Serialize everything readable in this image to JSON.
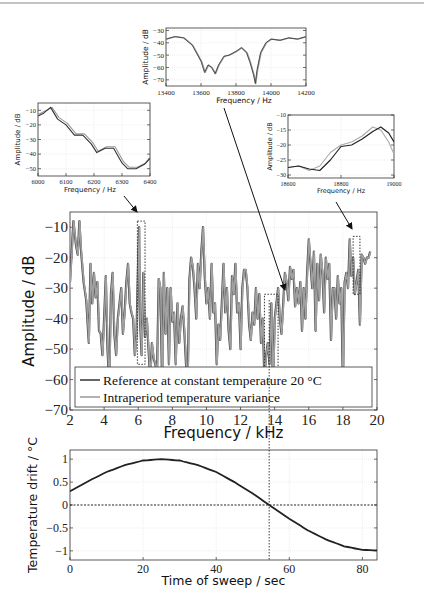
{
  "chart_data": [
    {
      "id": "inset_top",
      "type": "line",
      "xlabel": "Frequency / Hz",
      "ylabel": "Amplitude / dB",
      "xlim": [
        13400,
        14200
      ],
      "ylim": [
        -75,
        -28
      ],
      "xticks": [
        13400,
        13600,
        13800,
        14000,
        14200
      ],
      "yticks": [
        -30,
        -40,
        -50,
        -60,
        -70
      ],
      "grid": true,
      "series": [
        {
          "name": "Reference at constant temperature 20 °C",
          "color": "#444444",
          "x": [
            13400,
            13450,
            13500,
            13550,
            13600,
            13620,
            13640,
            13660,
            13680,
            13700,
            13730,
            13760,
            13800,
            13830,
            13860,
            13880,
            13900,
            13910,
            13920,
            13940,
            13970,
            14000,
            14050,
            14100,
            14150,
            14200
          ],
          "y": [
            -37,
            -35,
            -36,
            -42,
            -55,
            -64,
            -58,
            -60,
            -65,
            -58,
            -51,
            -50,
            -47,
            -44,
            -48,
            -56,
            -66,
            -73,
            -62,
            -48,
            -40,
            -37,
            -38,
            -36,
            -37,
            -35
          ]
        },
        {
          "name": "Intraperiod temperature variance",
          "color": "#999999",
          "x": [
            13400,
            13450,
            13500,
            13550,
            13600,
            13620,
            13640,
            13660,
            13680,
            13700,
            13730,
            13760,
            13800,
            13830,
            13860,
            13880,
            13900,
            13910,
            13920,
            13940,
            13970,
            14000,
            14050,
            14100,
            14150,
            14200
          ],
          "y": [
            -37,
            -35,
            -36,
            -42,
            -55,
            -64,
            -58,
            -60,
            -65,
            -58,
            -51,
            -50,
            -47,
            -44,
            -48,
            -56,
            -66,
            -73,
            -62,
            -48,
            -40,
            -37,
            -38,
            -36,
            -37,
            -35
          ]
        }
      ]
    },
    {
      "id": "inset_left",
      "type": "line",
      "xlabel": "Frequency / Hz",
      "ylabel": "Amplitude / dB",
      "xlim": [
        6000,
        6400
      ],
      "ylim": [
        -55,
        -5
      ],
      "xticks": [
        6000,
        6100,
        6200,
        6300,
        6400
      ],
      "yticks": [
        -10,
        -20,
        -30,
        -40,
        -50
      ],
      "grid": true,
      "series": [
        {
          "name": "Reference at constant temperature 20 °C",
          "color": "#333333",
          "x": [
            6000,
            6020,
            6045,
            6070,
            6100,
            6130,
            6160,
            6190,
            6210,
            6240,
            6270,
            6300,
            6320,
            6350,
            6380,
            6400
          ],
          "y": [
            -14,
            -12,
            -8,
            -16,
            -20,
            -27,
            -27,
            -33,
            -39,
            -36,
            -36,
            -46,
            -50,
            -50,
            -47,
            -43
          ]
        },
        {
          "name": "Intraperiod temperature variance",
          "color": "#999999",
          "x": [
            6000,
            6020,
            6050,
            6075,
            6105,
            6135,
            6165,
            6195,
            6215,
            6245,
            6275,
            6305,
            6325,
            6355,
            6385,
            6400
          ],
          "y": [
            -13,
            -11,
            -8,
            -15,
            -19,
            -26,
            -26,
            -32,
            -38,
            -35,
            -35,
            -45,
            -49,
            -49,
            -46,
            -42
          ]
        }
      ]
    },
    {
      "id": "inset_right",
      "type": "line",
      "xlabel": "Frequency / Hz",
      "ylabel": "Amplitude / dB",
      "xlim": [
        18600,
        19000
      ],
      "ylim": [
        -31,
        -10
      ],
      "xticks": [
        18600,
        18800,
        19000
      ],
      "yticks": [
        -10,
        -15,
        -20,
        -25,
        -30
      ],
      "grid": true,
      "series": [
        {
          "name": "Reference at constant temperature 20 °C",
          "color": "#222222",
          "x": [
            18600,
            18640,
            18680,
            18720,
            18760,
            18800,
            18840,
            18880,
            18920,
            18950,
            18980,
            19000
          ],
          "y": [
            -27.5,
            -27,
            -28,
            -28.5,
            -25,
            -20.5,
            -20,
            -18,
            -15.5,
            -14,
            -16,
            -19
          ]
        },
        {
          "name": "Intraperiod temperature variance",
          "color": "#aaaaaa",
          "x": [
            18600,
            18640,
            18680,
            18720,
            18760,
            18800,
            18840,
            18880,
            18920,
            18950,
            18980,
            19000
          ],
          "y": [
            -27.5,
            -27,
            -28.5,
            -27,
            -22.5,
            -20,
            -19,
            -17,
            -14,
            -15,
            -19,
            -23
          ]
        }
      ]
    },
    {
      "id": "main",
      "type": "line",
      "xlabel": "Frequency / kHz",
      "ylabel": "Amplitude / dB",
      "xlim": [
        2,
        20
      ],
      "ylim": [
        -70,
        -5
      ],
      "xticks": [
        2,
        4,
        6,
        8,
        10,
        12,
        14,
        16,
        18,
        20
      ],
      "yticks": [
        -10,
        -20,
        -30,
        -40,
        -50,
        -60,
        -70
      ],
      "grid": true,
      "legend": {
        "position": "lower left",
        "entries": [
          "Reference at constant temperature 20 °C",
          "Intraperiod temperature variance"
        ]
      },
      "zoom_boxes": [
        {
          "x": [
            5.95,
            6.4
          ],
          "y": [
            -8,
            -55
          ]
        },
        {
          "x": [
            13.4,
            14.2
          ],
          "y": [
            -32,
            -62
          ]
        },
        {
          "x": [
            18.6,
            19.0
          ],
          "y": [
            -13,
            -32
          ]
        }
      ],
      "series": [
        {
          "name": "Reference at constant temperature 20 °C",
          "color": "#444444",
          "x": [
            2.0,
            2.1,
            2.2,
            2.35,
            2.45,
            2.55,
            2.65,
            2.8,
            2.95,
            3.1,
            3.2,
            3.3,
            3.4,
            3.5,
            3.6,
            3.7,
            3.8,
            3.9,
            4.0,
            4.1,
            4.2,
            4.3,
            4.4,
            4.5,
            4.6,
            4.7,
            4.8,
            4.9,
            5.0,
            5.1,
            5.2,
            5.3,
            5.4,
            5.5,
            5.6,
            5.7,
            5.8,
            5.9,
            6.0,
            6.05,
            6.1,
            6.2,
            6.3,
            6.4,
            6.5,
            6.6,
            6.7,
            6.8,
            6.9,
            7.0,
            7.1,
            7.2,
            7.3,
            7.4,
            7.5,
            7.6,
            7.7,
            7.8,
            7.9,
            8.0,
            8.1,
            8.2,
            8.3,
            8.4,
            8.5,
            8.6,
            8.7,
            8.8,
            8.9,
            9.0,
            9.1,
            9.2,
            9.3,
            9.4,
            9.5,
            9.6,
            9.7,
            9.8,
            9.9,
            10.0,
            10.1,
            10.2,
            10.3,
            10.4,
            10.5,
            10.6,
            10.7,
            10.8,
            10.9,
            11.0,
            11.1,
            11.2,
            11.3,
            11.4,
            11.5,
            11.6,
            11.7,
            11.8,
            11.9,
            12.0,
            12.1,
            12.2,
            12.3,
            12.4,
            12.5,
            12.6,
            12.7,
            12.8,
            12.9,
            13.0,
            13.1,
            13.2,
            13.3,
            13.4,
            13.5,
            13.6,
            13.7,
            13.8,
            13.9,
            14.0,
            14.1,
            14.2,
            14.3,
            14.4,
            14.5,
            14.6,
            14.7,
            14.8,
            14.9,
            15.0,
            15.1,
            15.2,
            15.3,
            15.4,
            15.5,
            15.6,
            15.7,
            15.8,
            15.9,
            16.0,
            16.1,
            16.2,
            16.3,
            16.4,
            16.5,
            16.6,
            16.7,
            16.8,
            16.9,
            17.0,
            17.1,
            17.2,
            17.3,
            17.4,
            17.5,
            17.6,
            17.7,
            17.8,
            17.9,
            18.0,
            18.1,
            18.2,
            18.3,
            18.4,
            18.5,
            18.6,
            18.7,
            18.8,
            18.9,
            19.0,
            19.1,
            19.2,
            19.3,
            19.4,
            19.5,
            19.6,
            19.7,
            19.8,
            19.9,
            20.0
          ],
          "y": [
            -28,
            -18,
            -8,
            -16,
            -19,
            -8,
            -18,
            -28,
            -34,
            -48,
            -22,
            -35,
            -25,
            -33,
            -28,
            -44,
            -45,
            -52,
            -40,
            -26,
            -50,
            -62,
            -32,
            -25,
            -45,
            -52,
            -40,
            -35,
            -30,
            -45,
            -38,
            -28,
            -22,
            -35,
            -38,
            -40,
            -52,
            -45,
            -20,
            -10,
            -40,
            -52,
            -25,
            -46,
            -40,
            -50,
            -60,
            -48,
            -53,
            -55,
            -58,
            -27,
            -30,
            -62,
            -25,
            -45,
            -30,
            -55,
            -30,
            -41,
            -38,
            -55,
            -35,
            -48,
            -40,
            -36,
            -44,
            -55,
            -60,
            -27,
            -20,
            -23,
            -30,
            -40,
            -22,
            -30,
            -18,
            -10,
            -26,
            -35,
            -30,
            -40,
            -22,
            -38,
            -35,
            -55,
            -42,
            -47,
            -35,
            -22,
            -38,
            -30,
            -44,
            -50,
            -26,
            -32,
            -22,
            -38,
            -35,
            -50,
            -30,
            -24,
            -24,
            -30,
            -42,
            -47,
            -38,
            -42,
            -30,
            -40,
            -32,
            -48,
            -40,
            -60,
            -52,
            -48,
            -55,
            -35,
            -63,
            -40,
            -35,
            -30,
            -40,
            -45,
            -35,
            -25,
            -28,
            -34,
            -23,
            -27,
            -24,
            -36,
            -30,
            -35,
            -28,
            -44,
            -30,
            -40,
            -25,
            -14,
            -22,
            -30,
            -18,
            -44,
            -22,
            -34,
            -19,
            -25,
            -38,
            -20,
            -27,
            -22,
            -47,
            -30,
            -30,
            -40,
            -26,
            -35,
            -30,
            -62,
            -28,
            -25,
            -30,
            -14,
            -26,
            -20,
            -32,
            -28,
            -24,
            -42,
            -19,
            -20,
            -22,
            -20,
            -20,
            -18
          ],
          "note": "approximate reconstruction of dense oscillating trace"
        },
        {
          "name": "Intraperiod temperature variance",
          "color": "#999999",
          "note": "nearly identical to reference at main-plot scale"
        }
      ]
    },
    {
      "id": "bottom",
      "type": "line",
      "xlabel": "Time of sweep / sec",
      "ylabel": "Temperature drift / °C",
      "xlim": [
        0,
        84
      ],
      "ylim": [
        -1.2,
        1.2
      ],
      "xticks": [
        0,
        20,
        40,
        60,
        80
      ],
      "yticks": [
        1,
        0.5,
        0,
        -0.5,
        -1
      ],
      "yticklabels": [
        "1",
        "0.5",
        "0",
        "−0.5",
        "−1"
      ],
      "grid": true,
      "reference_lines": {
        "hline_y": 0,
        "vline_x": 54.5
      },
      "series": [
        {
          "name": "Temperature drift",
          "color": "#222222",
          "x": [
            0,
            5,
            10,
            15,
            20,
            25,
            30,
            35,
            40,
            45,
            50,
            54.5,
            60,
            65,
            70,
            75,
            80,
            84
          ],
          "y": [
            0.3,
            0.52,
            0.72,
            0.87,
            0.97,
            1.0,
            0.97,
            0.87,
            0.72,
            0.5,
            0.25,
            0.0,
            -0.3,
            -0.55,
            -0.75,
            -0.9,
            -0.98,
            -0.99
          ]
        }
      ]
    }
  ],
  "labels": {
    "main_ylabel": "Amplitude / dB",
    "main_xlabel": "Frequency / kHz",
    "legend_ref": "Reference at constant temperature 20 °C",
    "legend_var": "Intraperiod temperature variance",
    "inset_ylabel": "Amplitude / dB",
    "inset_xlabel": "Frequency / Hz",
    "bottom_ylabel": "Temperature drift / °C",
    "bottom_xlabel": "Time of sweep / sec"
  }
}
